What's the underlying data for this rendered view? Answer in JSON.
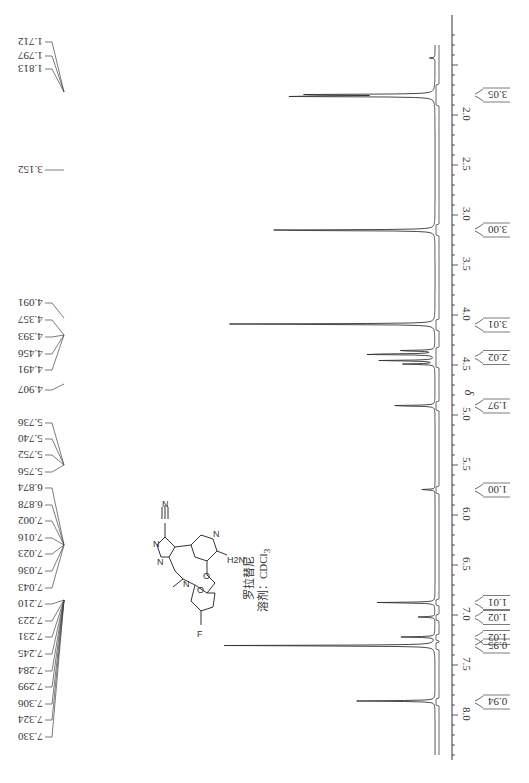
{
  "chart_data": {
    "type": "line",
    "orientation": "rotated 90° (chemical-shift axis runs top-to-bottom on right side)",
    "xlabel": "δ",
    "ylabel": "",
    "xlim": [
      1.2,
      8.5
    ],
    "axis_ticks": [
      2.0,
      2.5,
      3.0,
      3.5,
      4.0,
      4.5,
      5.0,
      5.5,
      6.0,
      6.5,
      7.0,
      7.5,
      8.0
    ],
    "peak_labels": [
      "1.712",
      "1.797",
      "1.813",
      "3.152",
      "4.091",
      "4.357",
      "4.393",
      "4.456",
      "4.491",
      "4.907",
      "5.736",
      "5.740",
      "5.752",
      "5.756",
      "6.874",
      "6.878",
      "7.002",
      "7.016",
      "7.023",
      "7.036",
      "7.043",
      "7.210",
      "7.223",
      "7.231",
      "7.245",
      "7.284",
      "7.299",
      "7.306",
      "7.324",
      "7.330"
    ],
    "peaks": [
      {
        "shift": 1.43,
        "height": 0.02,
        "note": "small broad"
      },
      {
        "shift": 1.797,
        "height": 0.55
      },
      {
        "shift": 1.813,
        "height": 0.62
      },
      {
        "shift": 3.152,
        "height": 0.72
      },
      {
        "shift": 4.091,
        "height": 0.78
      },
      {
        "shift": 4.357,
        "height": 0.15
      },
      {
        "shift": 4.393,
        "height": 0.3
      },
      {
        "shift": 4.456,
        "height": 0.21
      },
      {
        "shift": 4.491,
        "height": 0.12
      },
      {
        "shift": 4.907,
        "height": 0.18
      },
      {
        "shift": 5.746,
        "height": 0.05
      },
      {
        "shift": 6.876,
        "height": 0.22
      },
      {
        "shift": 7.02,
        "height": 0.06
      },
      {
        "shift": 7.22,
        "height": 0.12
      },
      {
        "shift": 7.306,
        "height": 0.8
      },
      {
        "shift": 7.86,
        "height": 0.28
      }
    ],
    "integrals": [
      {
        "range": [
          1.7,
          1.9
        ],
        "value": "3.05"
      },
      {
        "range": [
          3.1,
          3.2
        ],
        "value": "3.00"
      },
      {
        "range": [
          4.05,
          4.15
        ],
        "value": "3.01"
      },
      {
        "range": [
          4.33,
          4.52
        ],
        "value": "2.02"
      },
      {
        "range": [
          4.87,
          4.95
        ],
        "value": "1.97"
      },
      {
        "range": [
          5.72,
          5.78
        ],
        "value": "1.00"
      },
      {
        "range": [
          6.85,
          6.9
        ],
        "value": "1.01"
      },
      {
        "range": [
          7.0,
          7.05
        ],
        "value": "1.02"
      },
      {
        "range": [
          7.2,
          7.25
        ],
        "value": "1.02"
      },
      {
        "range": [
          7.28,
          7.34
        ],
        "value": "0.95"
      },
      {
        "range": [
          7.84,
          7.9
        ],
        "value": "0.94"
      }
    ],
    "grid": false,
    "legend": null
  },
  "structure": {
    "atoms": [
      "N",
      "N",
      "N",
      "N",
      "N",
      "O",
      "O",
      "F",
      "H2N"
    ],
    "compound_name": "罗拉替尼",
    "solvent_label": "溶剂：CDCl",
    "solvent_subscript": "3"
  },
  "axis": {
    "symbol": "δ"
  }
}
